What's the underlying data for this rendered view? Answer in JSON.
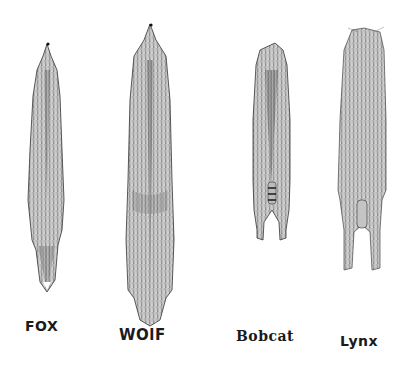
{
  "illustration": {
    "subject": "Stretched fur pelts, pen-and-ink drawing",
    "ink_color": "#1a1a1a",
    "background": "#ffffff",
    "pelts": [
      {
        "id": "fox",
        "label": "FOX",
        "label_x": 25,
        "label_y": 318
      },
      {
        "id": "wolf",
        "label": "WOlF",
        "label_x": 119,
        "label_y": 326
      },
      {
        "id": "bobcat",
        "label": "Bobcat",
        "label_x": 236,
        "label_y": 328
      },
      {
        "id": "lynx",
        "label": "Lynx",
        "label_x": 340,
        "label_y": 333
      }
    ]
  }
}
